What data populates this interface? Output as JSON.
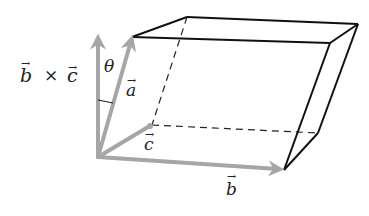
{
  "diagram": {
    "type": "parallelepiped-vectors",
    "labels": {
      "cross_product": "b⃗ × c⃗",
      "cross_b": "b",
      "cross_times": "×",
      "cross_c": "c",
      "theta": "θ",
      "a": "a",
      "b": "b",
      "c": "c",
      "arrow": "→"
    },
    "colors": {
      "vector": "#a6a6a6",
      "edge": "#111111",
      "dashed": "#222222"
    },
    "vertices": {
      "origin": [
        98,
        157
      ],
      "a_tip": [
        132,
        37
      ],
      "b_tip": [
        284,
        170
      ],
      "c_tip": [
        150,
        126
      ],
      "cross_tip": [
        98,
        35
      ],
      "top_back_left": [
        187,
        17
      ],
      "top_back_right": [
        358,
        24
      ],
      "top_front_right": [
        330,
        43
      ],
      "bottom_back_right": [
        318,
        133
      ]
    }
  }
}
